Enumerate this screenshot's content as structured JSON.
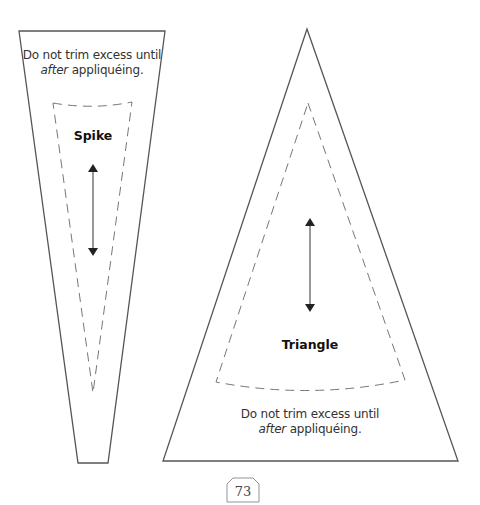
{
  "templates": {
    "spike": {
      "label": "Spike",
      "note_line1": "Do not trim excess until",
      "note_italic": "after",
      "note_rest": " appliquéing."
    },
    "triangle": {
      "label": "Triangle",
      "note_line1": "Do not trim excess until",
      "note_italic": "after",
      "note_rest": " appliquéing."
    }
  },
  "page": {
    "number": "73"
  },
  "colors": {
    "outline": "#555555",
    "dashed": "#777777",
    "arrow": "#222222"
  }
}
